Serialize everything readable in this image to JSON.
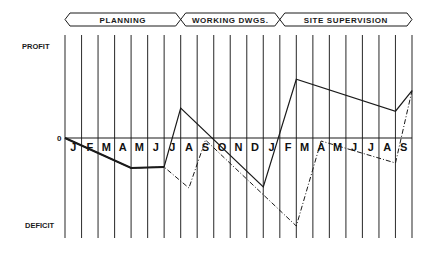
{
  "chart_data": {
    "type": "line",
    "title": "",
    "xlabel": "",
    "ylabel": "",
    "y_top_label": "PROFIT",
    "y_bottom_label": "DEFICIT",
    "zero_label": "0",
    "ylim": [
      -100,
      100
    ],
    "grid": "vertical",
    "phases": [
      {
        "label": "PLANNING",
        "start": 0,
        "end": 7
      },
      {
        "label": "WORKING DWGS.",
        "start": 7,
        "end": 13
      },
      {
        "label": "SITE SUPERVISION",
        "start": 13,
        "end": 21
      }
    ],
    "months": [
      "J",
      "F",
      "M",
      "A",
      "M",
      "J",
      "J",
      "A",
      "S",
      "O",
      "N",
      "D",
      "J",
      "F",
      "M",
      "A",
      "M",
      "J",
      "J",
      "A",
      "S"
    ],
    "series": [
      {
        "name": "solid",
        "style": "solid",
        "points": [
          [
            0,
            0
          ],
          [
            4,
            -30
          ],
          [
            6,
            -29
          ],
          [
            7,
            29
          ],
          [
            12,
            -49
          ],
          [
            14,
            57
          ],
          [
            20,
            26
          ],
          [
            21,
            46
          ]
        ]
      },
      {
        "name": "dash-dot",
        "style": "dashdot",
        "points": [
          [
            0,
            0
          ],
          [
            4,
            -30
          ],
          [
            6,
            -29
          ],
          [
            7.5,
            -50
          ],
          [
            8.5,
            -2
          ],
          [
            14,
            -88
          ],
          [
            15.5,
            -3
          ],
          [
            20,
            -25
          ],
          [
            21,
            46
          ]
        ]
      }
    ],
    "colors": {
      "ink": "#1a1a1a",
      "grid": "#3a3a3a"
    }
  }
}
